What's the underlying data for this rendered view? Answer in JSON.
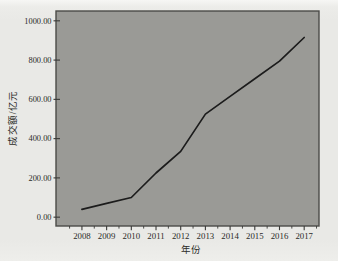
{
  "chart": {
    "y_axis_title": "成交额/亿元",
    "x_axis_title": "年份",
    "colors": {
      "page_bg": "#eaeae7",
      "plot_bg": "#9a9a96",
      "frame": "#4b4b48",
      "line": "#1c1c1c",
      "tick": "#3a3a38",
      "text": "#2b2b28"
    }
  },
  "chart_data": {
    "type": "line",
    "title": "",
    "xlabel": "年份",
    "ylabel": "成交额/亿元",
    "x": [
      2008,
      2009,
      2010,
      2011,
      2012,
      2013,
      2014,
      2015,
      2016,
      2017
    ],
    "series": [
      {
        "name": "成交额",
        "values": [
          40,
          70,
          100,
          225,
          335,
          525,
          615,
          705,
          795,
          915
        ]
      }
    ],
    "x_tick_labels": [
      "2008",
      "2009",
      "2010",
      "2011",
      "2012",
      "2013",
      "2014",
      "2015",
      "2016",
      "2017"
    ],
    "y_ticks": [
      0,
      200,
      400,
      600,
      800,
      1000
    ],
    "y_tick_labels": [
      "0.00",
      "200.00",
      "400.00",
      "600.00",
      "800.00",
      "1000.00"
    ],
    "xlim": [
      2006.95,
      2017.6
    ],
    "ylim": [
      -45,
      1050
    ],
    "x_minor_ticks": [
      2007.5,
      2008.5,
      2009.5,
      2010.5,
      2011.5,
      2012.5,
      2013.5,
      2014.5,
      2015.5,
      2016.5,
      2017.5
    ],
    "grid": false,
    "legend_position": "none",
    "plot_background": "gray-filled"
  }
}
